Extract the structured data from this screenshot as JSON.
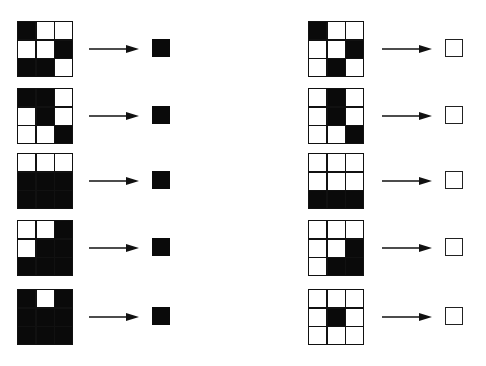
{
  "colors": {
    "on": "#0a0a0a",
    "off": "#ffffff"
  },
  "left_column": {
    "label": "positive examples",
    "output": 1,
    "rows": [
      {
        "grid": [
          [
            1,
            0,
            0
          ],
          [
            0,
            0,
            1
          ],
          [
            1,
            1,
            0
          ]
        ],
        "output": 1
      },
      {
        "grid": [
          [
            1,
            1,
            0
          ],
          [
            0,
            1,
            0
          ],
          [
            0,
            0,
            1
          ]
        ],
        "output": 1
      },
      {
        "grid": [
          [
            0,
            0,
            0
          ],
          [
            1,
            1,
            1
          ],
          [
            1,
            1,
            1
          ]
        ],
        "output": 1
      },
      {
        "grid": [
          [
            0,
            0,
            1
          ],
          [
            0,
            1,
            1
          ],
          [
            1,
            1,
            1
          ]
        ],
        "output": 1
      },
      {
        "grid": [
          [
            1,
            0,
            1
          ],
          [
            1,
            1,
            1
          ],
          [
            1,
            1,
            1
          ]
        ],
        "output": 1
      }
    ]
  },
  "right_column": {
    "label": "negative examples",
    "output": 0,
    "rows": [
      {
        "grid": [
          [
            1,
            0,
            0
          ],
          [
            0,
            0,
            1
          ],
          [
            0,
            1,
            0
          ]
        ],
        "output": 0
      },
      {
        "grid": [
          [
            0,
            1,
            0
          ],
          [
            0,
            1,
            0
          ],
          [
            0,
            0,
            1
          ]
        ],
        "output": 0
      },
      {
        "grid": [
          [
            0,
            0,
            0
          ],
          [
            0,
            0,
            0
          ],
          [
            1,
            1,
            1
          ]
        ],
        "output": 0
      },
      {
        "grid": [
          [
            0,
            0,
            0
          ],
          [
            0,
            0,
            1
          ],
          [
            0,
            1,
            1
          ]
        ],
        "output": 0
      },
      {
        "grid": [
          [
            0,
            0,
            0
          ],
          [
            0,
            1,
            0
          ],
          [
            0,
            0,
            0
          ]
        ],
        "output": 0
      }
    ]
  },
  "icons": {
    "arrow": "right-arrow-icon"
  }
}
